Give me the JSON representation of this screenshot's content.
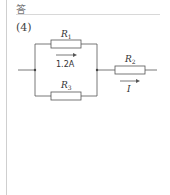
{
  "header": {
    "label": "答"
  },
  "question": {
    "number": "(4)"
  },
  "circuit": {
    "resistors": [
      {
        "name": "R",
        "sub": "1",
        "position": "top-parallel"
      },
      {
        "name": "R",
        "sub": "3",
        "position": "bottom-parallel"
      },
      {
        "name": "R",
        "sub": "2",
        "position": "series-right"
      }
    ],
    "branch_current": "1.2A",
    "total_current": "I"
  }
}
